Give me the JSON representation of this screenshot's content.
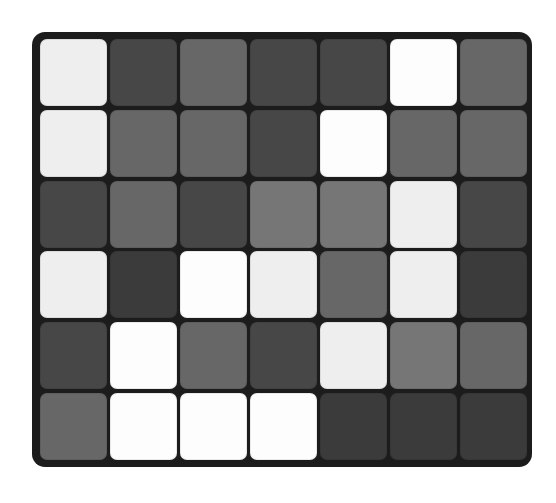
{
  "board": {
    "rows": 6,
    "cols": 7,
    "background": "#1c1c1c",
    "palette": {
      "white": "#fdfdfd",
      "offwhite": "#eeeeee",
      "lightgray": "#767676",
      "midgray": "#676767",
      "darkgray": "#474747",
      "darkest": "#3b3b3b"
    },
    "cells": [
      [
        "offwhite",
        "darkgray",
        "midgray",
        "darkgray",
        "darkgray",
        "white",
        "midgray"
      ],
      [
        "offwhite",
        "midgray",
        "midgray",
        "darkgray",
        "white",
        "midgray",
        "midgray"
      ],
      [
        "darkgray",
        "midgray",
        "darkgray",
        "lightgray",
        "lightgray",
        "offwhite",
        "darkgray"
      ],
      [
        "offwhite",
        "darkest",
        "white",
        "offwhite",
        "midgray",
        "offwhite",
        "darkest"
      ],
      [
        "darkgray",
        "white",
        "midgray",
        "darkgray",
        "offwhite",
        "lightgray",
        "midgray"
      ],
      [
        "midgray",
        "white",
        "white",
        "white",
        "darkest",
        "darkest",
        "darkest"
      ]
    ]
  }
}
